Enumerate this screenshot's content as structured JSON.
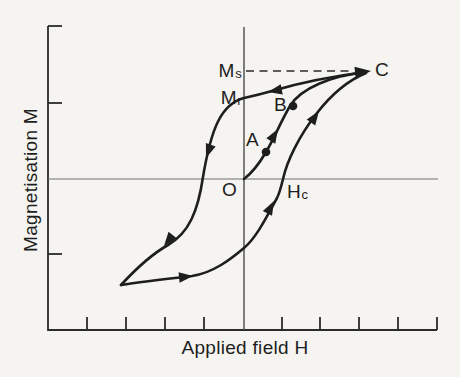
{
  "figure": {
    "background_color": "#f5f4f0",
    "ink_color": "#1e1e1e",
    "axis_color": "#2b2b2b",
    "zero_line_color": "#707070"
  },
  "axes": {
    "y_label": "Magnetisation M",
    "x_label": "Applied field H"
  },
  "labels": {
    "saturation": {
      "base": "M",
      "sub": "s"
    },
    "remanence": {
      "base": "M",
      "sub": "r"
    },
    "coercive": {
      "base": "H",
      "sub": "c"
    },
    "origin": "O",
    "point_a": "A",
    "point_b": "B",
    "point_c": "C"
  },
  "diagram_data": {
    "type": "line",
    "subject": "magnetic hysteresis loop, M versus H",
    "xlabel": "Applied field H",
    "ylabel": "Magnetisation M",
    "axis_text_visible": [
      "Magnetisation M",
      "Applied field H",
      "Ms",
      "Mr",
      "Hc",
      "O",
      "A",
      "B",
      "C"
    ],
    "curves": [
      {
        "name": "initial-magnetisation-curve",
        "from": "O",
        "through_marked_dots": [
          "A",
          "B"
        ],
        "to": "C",
        "arrow_direction": "towards C"
      },
      {
        "name": "upper-hysteresis-branch",
        "from": "C",
        "crosses_vertical_axis_at": "Mr",
        "to": "lower-left tip",
        "arrow_direction": "away from C (leftwards, downwards)"
      },
      {
        "name": "lower-hysteresis-branch",
        "from": "lower-left tip",
        "crosses_horizontal_axis_at": "Hc",
        "to": "C",
        "arrow_direction": "towards C (rightwards, upwards)"
      }
    ],
    "dashed_guide_line": "horizontal dashed line at level Ms from vertical axis to point C",
    "marked_dots": [
      "A",
      "B"
    ],
    "tick_marks": {
      "left_axis_count": 3,
      "bottom_axis_count": 9
    }
  }
}
